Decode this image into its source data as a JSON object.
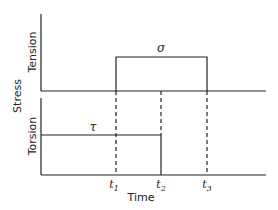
{
  "diagram": {
    "y_axis_label": "Stress",
    "x_axis_label": "Time",
    "panels": [
      {
        "name": "Tension",
        "signal_label": "σ",
        "description": "Step on at t1, off at t3"
      },
      {
        "name": "Torsion",
        "signal_label": "τ",
        "description": "Constant from start, off at t2"
      }
    ],
    "time_markers": [
      {
        "label": "t",
        "sub": "1"
      },
      {
        "label": "t",
        "sub": "2"
      },
      {
        "label": "t",
        "sub": "3"
      }
    ],
    "colors": {
      "line": "#222222",
      "background": "#ffffff"
    }
  }
}
